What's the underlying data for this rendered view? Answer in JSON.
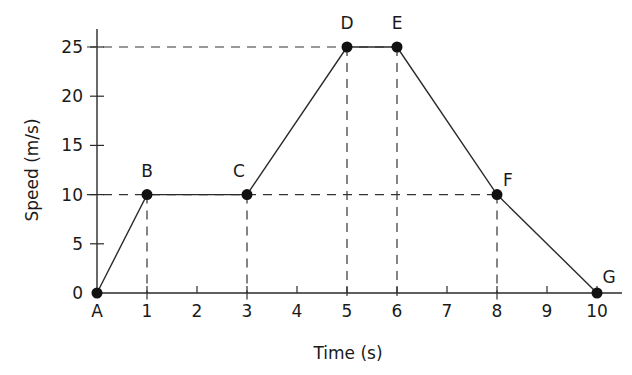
{
  "chart_data": {
    "type": "line",
    "title": "",
    "xlabel": "Time (s)",
    "ylabel": "Speed (m/s)",
    "xlim": [
      0,
      10.5
    ],
    "ylim": [
      0,
      26.5
    ],
    "grid": false,
    "x_ticks": [
      {
        "value": 0,
        "label": "A"
      },
      {
        "value": 1,
        "label": "1"
      },
      {
        "value": 2,
        "label": "2"
      },
      {
        "value": 3,
        "label": "3"
      },
      {
        "value": 4,
        "label": "4"
      },
      {
        "value": 5,
        "label": "5"
      },
      {
        "value": 6,
        "label": "6"
      },
      {
        "value": 7,
        "label": "7"
      },
      {
        "value": 8,
        "label": "8"
      },
      {
        "value": 9,
        "label": "9"
      },
      {
        "value": 10,
        "label": "10"
      }
    ],
    "y_ticks": [
      {
        "value": 0,
        "label": "0"
      },
      {
        "value": 5,
        "label": "5"
      },
      {
        "value": 10,
        "label": "10"
      },
      {
        "value": 15,
        "label": "15"
      },
      {
        "value": 20,
        "label": "20"
      },
      {
        "value": 25,
        "label": "25"
      }
    ],
    "series": [
      {
        "name": "speed",
        "points": [
          {
            "label": "A",
            "x": 0,
            "y": 0
          },
          {
            "label": "B",
            "x": 1,
            "y": 10
          },
          {
            "label": "C",
            "x": 3,
            "y": 10
          },
          {
            "label": "D",
            "x": 5,
            "y": 25
          },
          {
            "label": "E",
            "x": 6,
            "y": 25
          },
          {
            "label": "F",
            "x": 8,
            "y": 10
          },
          {
            "label": "G",
            "x": 10,
            "y": 0
          }
        ]
      }
    ],
    "reference_lines": {
      "horizontal": [
        10,
        25
      ],
      "vertical": [
        1,
        3,
        5,
        6,
        8
      ]
    },
    "colors": {
      "line": "#2a2a2a",
      "axis": "#2a2a2a",
      "dash": "#333333",
      "point": "#111111"
    }
  }
}
